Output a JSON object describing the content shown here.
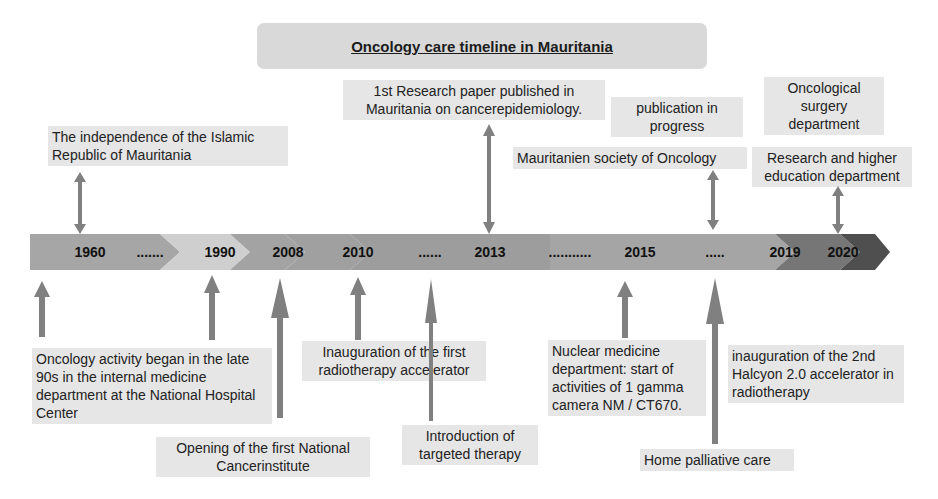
{
  "title": "Oncology care timeline in Mauritania",
  "timeline": {
    "segments": [
      {
        "label": "1960",
        "color": "#a6a6a6"
      },
      {
        "label": ".......",
        "color": "#cfcfcf"
      },
      {
        "label": "1990",
        "color": "#a3a3a3"
      },
      {
        "label": "2008",
        "color": "#a0a0a0"
      },
      {
        "label": "2010",
        "color": "#9d9d9d"
      },
      {
        "label": "......",
        "color": "#9d9d9d"
      },
      {
        "label": "2013",
        "color": "#a0a0a0"
      },
      {
        "label": "...........",
        "color": "#a0a0a0"
      },
      {
        "label": "2015",
        "color": "#a3a3a3"
      },
      {
        "label": ".....",
        "color": "#a3a3a3"
      },
      {
        "label": "2019",
        "color": "#777777"
      },
      {
        "label": "2020",
        "color": "#555555"
      }
    ]
  },
  "events_above": [
    {
      "text": "The independence of the Islamic Republic of Mauritania",
      "year": "1960"
    },
    {
      "text": "1st Research paper published in Mauritania on cancerepidemiology.",
      "year": "2013"
    },
    {
      "text": "publication in progress",
      "year": "2015"
    },
    {
      "text": "Mauritanien society of Oncology",
      "year": "....."
    },
    {
      "text": "Oncological surgery department",
      "year": "2020"
    },
    {
      "text": "Research and higher education department",
      "year": "2020"
    }
  ],
  "events_below": [
    {
      "text": "Oncology activity began in the late 90s in the internal medicine department at the National Hospital Center",
      "year": "1990"
    },
    {
      "text": "Opening of the first National Cancerinstitute",
      "year": "2008"
    },
    {
      "text": "Inauguration of the first radiotherapy accelerator",
      "year": "2010"
    },
    {
      "text": "Introduction of targeted therapy",
      "year": "......"
    },
    {
      "text": "Nuclear medicine department: start of activities of 1 gamma camera NM / CT670.",
      "year": "2015"
    },
    {
      "text": "inauguration of the 2nd Halcyon 2.0 accelerator in radiotherapy",
      "year": "2019"
    },
    {
      "text": "Home palliative care",
      "year": "....."
    }
  ],
  "colors": {
    "arrow": "#808080",
    "label_bg": "#e6e6e6",
    "title_bg": "#d9d9d9"
  }
}
